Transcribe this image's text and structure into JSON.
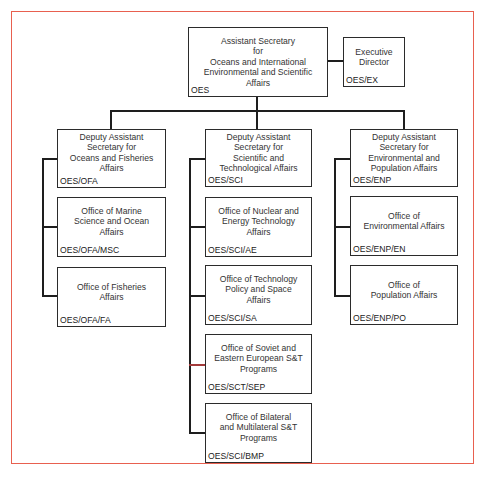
{
  "chart": {
    "top": {
      "title_lines": [
        "Assistant Secretary",
        "for",
        "Oceans and International",
        "Environmental and Scientific",
        "Affairs"
      ],
      "code": "OES"
    },
    "executive": {
      "title_lines": [
        "Executive",
        "Director"
      ],
      "code": "OES/EX"
    },
    "columns": [
      {
        "head": {
          "title_lines": [
            "Deputy Assistant",
            "Secretary for",
            "Oceans and Fisheries",
            "Affairs"
          ],
          "code": "OES/OFA"
        },
        "offices": [
          {
            "title_lines": [
              "Office of Marine",
              "Science and Ocean",
              "Affairs"
            ],
            "code": "OES/OFA/MSC"
          },
          {
            "title_lines": [
              "Office of Fisheries",
              "Affairs"
            ],
            "code": "OES/OFA/FA"
          }
        ]
      },
      {
        "head": {
          "title_lines": [
            "Deputy Assistant",
            "Secretary for",
            "Scientific and",
            "Technological Affairs"
          ],
          "code": "OES/SCI"
        },
        "offices": [
          {
            "title_lines": [
              "Office of Nuclear and",
              "Energy Technology",
              "Affairs"
            ],
            "code": "OES/SCI/AE"
          },
          {
            "title_lines": [
              "Office of Technology",
              "Policy and Space",
              "Affairs"
            ],
            "code": "OES/SCI/SA"
          },
          {
            "title_lines": [
              "Office of Soviet and",
              "Eastern European S&T",
              "Programs"
            ],
            "code": "OES/SCT/SEP"
          },
          {
            "title_lines": [
              "Office of Bilateral",
              "and Multilateral S&T",
              "Programs"
            ],
            "code": "OES/SCI/BMP"
          }
        ]
      },
      {
        "head": {
          "title_lines": [
            "Deputy Assistant",
            "Secretary for",
            "Environmental and",
            "Population Affairs"
          ],
          "code": "OES/ENP"
        },
        "offices": [
          {
            "title_lines": [
              "Office of",
              "Environmental Affairs"
            ],
            "code": "OES/ENP/EN"
          },
          {
            "title_lines": [
              "Office of",
              "Population Affairs"
            ],
            "code": "OES/ENP/PO"
          }
        ]
      }
    ]
  },
  "colors": {
    "frame": "#e8604f",
    "box_border": "#2b2b2b",
    "connector": "#1e1e1e",
    "highlight_connector": "#a33a3a"
  }
}
